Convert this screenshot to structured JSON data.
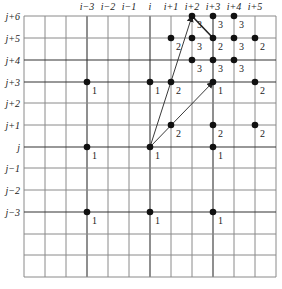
{
  "grid": {
    "x_lines": [
      24,
      45,
      66,
      87,
      108,
      129,
      150,
      171,
      192,
      213,
      234,
      255,
      276
    ],
    "y_lines": [
      16,
      38,
      60,
      82,
      103,
      125,
      147,
      168,
      190,
      212,
      234,
      255,
      277
    ],
    "dark_x_lines": [
      87,
      150,
      213
    ],
    "dark_y_lines": [
      60,
      82,
      147,
      212
    ],
    "line_color": "#8a8a8a",
    "dark_line_color": "#333333"
  },
  "column_labels": [
    {
      "text": "i−3",
      "x": 87
    },
    {
      "text": "i−2",
      "x": 108
    },
    {
      "text": "i−1",
      "x": 129
    },
    {
      "text": "i",
      "x": 150
    },
    {
      "text": "i+1",
      "x": 171
    },
    {
      "text": "i+2",
      "x": 192
    },
    {
      "text": "i+3",
      "x": 213
    },
    {
      "text": "i+4",
      "x": 234
    },
    {
      "text": "i+5",
      "x": 255
    }
  ],
  "row_labels": [
    {
      "text": "j+6",
      "y": 16
    },
    {
      "text": "j+5",
      "y": 38
    },
    {
      "text": "j+4",
      "y": 60
    },
    {
      "text": "j+3",
      "y": 82
    },
    {
      "text": "j+2",
      "y": 103
    },
    {
      "text": "j+1",
      "y": 125
    },
    {
      "text": "j",
      "y": 147
    },
    {
      "text": "j−1",
      "y": 168
    },
    {
      "text": "j−2",
      "y": 190
    },
    {
      "text": "j−3",
      "y": 212
    }
  ],
  "points": [
    {
      "x": 192,
      "y": 16,
      "label": "3"
    },
    {
      "x": 213,
      "y": 16,
      "label": "3"
    },
    {
      "x": 234,
      "y": 16,
      "label": "3"
    },
    {
      "x": 171,
      "y": 38,
      "label": "2"
    },
    {
      "x": 192,
      "y": 38,
      "label": "3"
    },
    {
      "x": 213,
      "y": 38,
      "label": "2"
    },
    {
      "x": 234,
      "y": 38,
      "label": "3"
    },
    {
      "x": 255,
      "y": 38,
      "label": "2"
    },
    {
      "x": 192,
      "y": 60,
      "label": "3"
    },
    {
      "x": 213,
      "y": 60,
      "label": "3"
    },
    {
      "x": 234,
      "y": 60,
      "label": "3"
    },
    {
      "x": 87,
      "y": 82,
      "label": "1"
    },
    {
      "x": 150,
      "y": 82,
      "label": "1"
    },
    {
      "x": 171,
      "y": 82,
      "label": "2"
    },
    {
      "x": 213,
      "y": 82,
      "label": "1"
    },
    {
      "x": 255,
      "y": 82,
      "label": "2"
    },
    {
      "x": 171,
      "y": 125,
      "label": "2"
    },
    {
      "x": 213,
      "y": 125,
      "label": "2"
    },
    {
      "x": 255,
      "y": 125,
      "label": "2"
    },
    {
      "x": 87,
      "y": 147,
      "label": "1"
    },
    {
      "x": 150,
      "y": 147,
      "label": "1"
    },
    {
      "x": 213,
      "y": 147,
      "label": "1"
    },
    {
      "x": 87,
      "y": 212,
      "label": "1"
    },
    {
      "x": 150,
      "y": 212,
      "label": "1"
    },
    {
      "x": 213,
      "y": 212,
      "label": "1"
    }
  ],
  "arrows": [
    {
      "from": [
        150,
        147
      ],
      "to": [
        192,
        16
      ],
      "head": true
    },
    {
      "from": [
        150,
        147
      ],
      "to": [
        213,
        82
      ],
      "head": true
    }
  ],
  "segments": [
    {
      "from": [
        192,
        16
      ],
      "to": [
        213,
        38
      ],
      "width": 1.6
    }
  ]
}
